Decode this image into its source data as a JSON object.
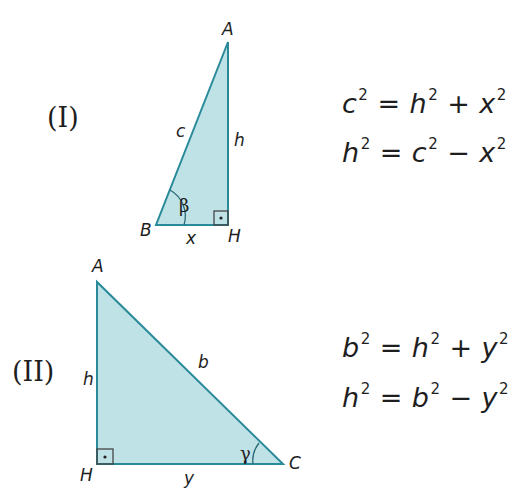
{
  "colors": {
    "fill": "#bfe2e6",
    "stroke": "#2a8a9a",
    "marker": "#444444"
  },
  "figure_1": {
    "label": "(I)",
    "vertices": {
      "A": "A",
      "B": "B",
      "H": "H"
    },
    "sides": {
      "hypotenuse": "c",
      "leg_vertical": "h",
      "leg_horizontal": "x"
    },
    "angle": "β",
    "equations": [
      {
        "lhs": "c",
        "op1": "=",
        "t1": "h",
        "op2": "+",
        "t2": "x",
        "exp": "2"
      },
      {
        "lhs": "h",
        "op1": "=",
        "t1": "c",
        "op2": "−",
        "t2": "x",
        "exp": "2"
      }
    ]
  },
  "figure_2": {
    "label": "(II)",
    "vertices": {
      "A": "A",
      "H": "H",
      "C": "C"
    },
    "sides": {
      "hypotenuse": "b",
      "leg_vertical": "h",
      "leg_horizontal": "y"
    },
    "angle": "γ",
    "equations": [
      {
        "lhs": "b",
        "op1": "=",
        "t1": "h",
        "op2": "+",
        "t2": "y",
        "exp": "2"
      },
      {
        "lhs": "h",
        "op1": "=",
        "t1": "b",
        "op2": "−",
        "t2": "y",
        "exp": "2"
      }
    ]
  }
}
